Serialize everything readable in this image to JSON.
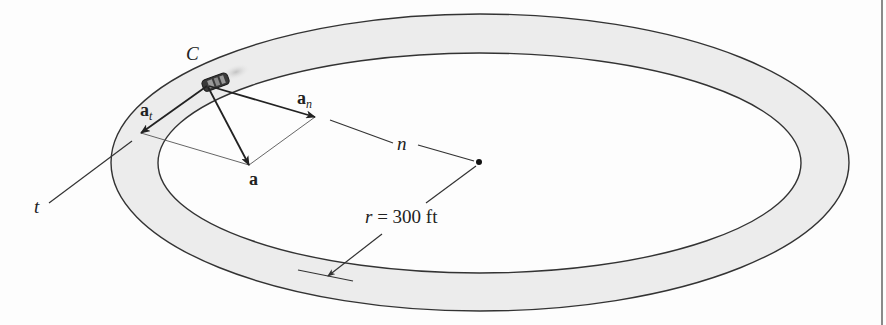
{
  "figure": {
    "colors": {
      "track_fill": "#ececec",
      "track_edge": "#333333",
      "vector": "#222222",
      "construction_line": "#555555",
      "background": "#fdfdfd"
    },
    "labels": {
      "car": "C",
      "tangential_accel_base": "a",
      "tangential_accel_sub": "t",
      "normal_accel_base": "a",
      "normal_accel_sub": "n",
      "total_accel": "a",
      "normal_axis": "n",
      "tangent_axis": "t",
      "radius": "r = 300 ft"
    }
  }
}
